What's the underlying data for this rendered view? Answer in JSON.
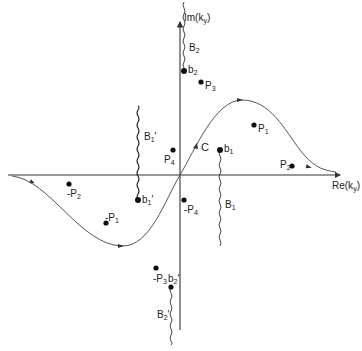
{
  "diagram": {
    "axes": {
      "vertical_label": "Im(k",
      "vertical_sub": "y",
      "vertical_close": ")",
      "horizontal_label": "Re(k",
      "horizontal_sub": "y",
      "horizontal_close": ")"
    },
    "contour_label": "C",
    "points": [
      {
        "id": "b2",
        "base": "b",
        "sub": "2",
        "prime": ""
      },
      {
        "id": "P3",
        "base": "P",
        "sub": "3",
        "prime": ""
      },
      {
        "id": "P4",
        "base": "P",
        "sub": "4",
        "prime": ""
      },
      {
        "id": "b1",
        "base": "b",
        "sub": "1",
        "prime": ""
      },
      {
        "id": "P1",
        "base": "P",
        "sub": "1",
        "prime": ""
      },
      {
        "id": "P2",
        "base": "P",
        "sub": "2",
        "prime": ""
      },
      {
        "id": "-P4",
        "base": "-P",
        "sub": "4",
        "prime": ""
      },
      {
        "id": "b1'",
        "base": "b",
        "sub": "1",
        "prime": "'"
      },
      {
        "id": "-P2",
        "base": "-P",
        "sub": "2",
        "prime": ""
      },
      {
        "id": "-P1",
        "base": "-P",
        "sub": "1",
        "prime": ""
      },
      {
        "id": "-P3",
        "base": "-P",
        "sub": "3",
        "prime": ""
      },
      {
        "id": "b2'",
        "base": "b",
        "sub": "2",
        "prime": "'"
      }
    ],
    "branch_cuts": [
      {
        "id": "B2",
        "base": "B",
        "sub": "2",
        "prime": ""
      },
      {
        "id": "B1",
        "base": "B",
        "sub": "1",
        "prime": ""
      },
      {
        "id": "B1'",
        "base": "B",
        "sub": "1",
        "prime": "'"
      },
      {
        "id": "B2'",
        "base": "B",
        "sub": "2",
        "prime": "'"
      }
    ]
  }
}
